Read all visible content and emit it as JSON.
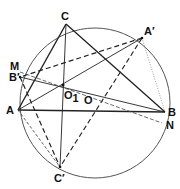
{
  "diagram": {
    "type": "geometry-circle-construction",
    "circle": {
      "label": "O",
      "cx": 95,
      "cy": 103,
      "r": 75
    },
    "points": {
      "C": {
        "label": "C",
        "x": 66,
        "y": 24
      },
      "A1": {
        "label": "A′",
        "x": 142,
        "y": 38
      },
      "M": {
        "label": "M",
        "x": 20,
        "y": 70
      },
      "B1": {
        "label": "B′",
        "x": 20,
        "y": 77
      },
      "A": {
        "label": "A",
        "x": 18,
        "y": 110
      },
      "B": {
        "label": "B",
        "x": 165,
        "y": 112
      },
      "N": {
        "label": "N",
        "x": 162,
        "y": 123
      },
      "C1": {
        "label": "C′",
        "x": 60,
        "y": 167
      },
      "O1": {
        "label": "O",
        "sub": "1",
        "x": 63,
        "y": 85
      },
      "O": {
        "label": "O",
        "x": 95,
        "y": 103
      }
    },
    "labels": {
      "C": "C",
      "A_prime": "A′",
      "M": "M",
      "B_prime": "B′",
      "A": "A",
      "O1_main": "O",
      "O1_sub": "1",
      "O": "O",
      "B": "B",
      "N": "N",
      "C_prime": "C′"
    },
    "line_styles": {
      "solid": "#222222",
      "dashed": "#222222",
      "dotted": "#888888",
      "circle": "#555555"
    }
  }
}
